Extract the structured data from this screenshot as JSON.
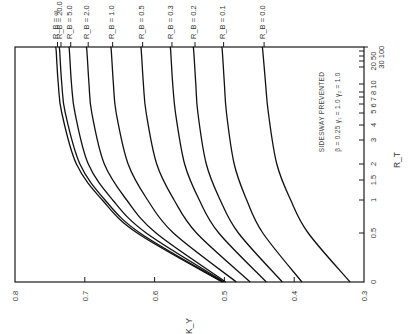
{
  "chart_data": {
    "type": "line",
    "orientation": "rotated-90-clockwise",
    "title": "",
    "annotation": {
      "line1": "SIDESWAY PREVENTED",
      "line2": "β = 0.25   γ₁ = 1.0   γ₂ = 1.0"
    },
    "xlabel": "R_T",
    "ylabel": "K_Y",
    "x_scale": "nonlinear (compressed toward ∞)",
    "x_ticks": [
      "0",
      "0.5",
      "1",
      "1.5",
      "2",
      "3",
      "4",
      "5",
      "6",
      "7",
      "8",
      "10",
      "20",
      "30",
      "50",
      "100",
      "∞"
    ],
    "x_tick_labels_shown": [
      "0",
      "0.5",
      "1",
      "1.5",
      "2",
      "3",
      "4",
      "5 6 7 8 10",
      "20 50",
      "30 100"
    ],
    "y_ticks": [
      0.3,
      0.4,
      0.5,
      0.6,
      0.7,
      0.8
    ],
    "y_tick_labels": [
      "0.3",
      "0.4",
      "0.5",
      "0.6",
      "0.7",
      "0.8"
    ],
    "ylim": [
      0.3,
      0.8
    ],
    "grid": false,
    "legend": "curve labels at R_T = ∞ end",
    "x": [
      0,
      0.5,
      1,
      2,
      5,
      10,
      100,
      "∞"
    ],
    "series": [
      {
        "name": "R_B = ∞",
        "label": "R_B = ∞",
        "values": [
          0.503,
          0.625,
          0.675,
          0.712,
          0.733,
          0.738,
          0.741,
          0.742
        ]
      },
      {
        "name": "R_B = 20.0",
        "label": "R_B = 20.0",
        "values": [
          0.502,
          0.621,
          0.671,
          0.707,
          0.728,
          0.733,
          0.736,
          0.737
        ]
      },
      {
        "name": "R_B = 5.0",
        "label": "R_B = 5.0",
        "values": [
          0.5,
          0.612,
          0.66,
          0.695,
          0.714,
          0.719,
          0.722,
          0.723
        ]
      },
      {
        "name": "R_B = 2.0",
        "label": "R_B = 2.0",
        "values": [
          0.498,
          0.598,
          0.64,
          0.672,
          0.69,
          0.694,
          0.697,
          0.698
        ]
      },
      {
        "name": "R_B = 1.0",
        "label": "R_B = 1.0",
        "values": [
          0.483,
          0.573,
          0.61,
          0.638,
          0.655,
          0.659,
          0.662,
          0.663
        ]
      },
      {
        "name": "R_B = 0.5",
        "label": "R_B = 0.5",
        "values": [
          0.463,
          0.54,
          0.572,
          0.597,
          0.612,
          0.616,
          0.619,
          0.62
        ]
      },
      {
        "name": "R_B = 0.3",
        "label": "R_B = 0.3",
        "values": [
          0.44,
          0.508,
          0.536,
          0.557,
          0.57,
          0.574,
          0.577,
          0.578
        ]
      },
      {
        "name": "R_B = 0.2",
        "label": "R_B = 0.2",
        "values": [
          0.417,
          0.48,
          0.506,
          0.526,
          0.538,
          0.541,
          0.544,
          0.545
        ]
      },
      {
        "name": "R_B = 0.1",
        "label": "R_B = 0.1",
        "values": [
          0.389,
          0.445,
          0.468,
          0.486,
          0.497,
          0.5,
          0.503,
          0.504
        ]
      },
      {
        "name": "R_B = 0.0",
        "label": "R_B = 0.0",
        "values": [
          0.32,
          0.38,
          0.405,
          0.425,
          0.437,
          0.441,
          0.445,
          0.446
        ]
      }
    ]
  }
}
